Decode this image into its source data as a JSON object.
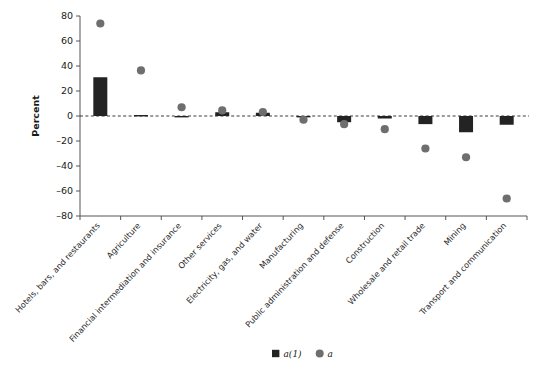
{
  "chart_data": {
    "type": "bar",
    "title": "",
    "subtitle": "",
    "xlabel": "",
    "ylabel": "Percent",
    "ylim": [
      -80,
      80
    ],
    "yticks": [
      80,
      60,
      40,
      20,
      0,
      -20,
      -40,
      -60,
      -80
    ],
    "ytick_labels": [
      "80",
      "60",
      "40",
      "20",
      "0",
      "–20",
      "–40",
      "–60",
      "–80"
    ],
    "grid": false,
    "zero_line": true,
    "legend_position": "bottom-center",
    "categories": [
      "Hotels, bars, and restaurants",
      "Agriculture",
      "Financial intermediation and insurance",
      "Other services",
      "Electricity, gas, and water",
      "Manufacturing",
      "Public administration and defense",
      "Construction",
      "Wholesale and retail trade",
      "Mining",
      "Transport and communication"
    ],
    "series": [
      {
        "name": "a(1)",
        "marker": "square",
        "color": "#232323",
        "render": "bar",
        "values": [
          31,
          0.8,
          -0.5,
          3.0,
          2.6,
          -0.8,
          -5.0,
          -2.0,
          -6.5,
          -13.0,
          -7.0
        ]
      },
      {
        "name": "a",
        "marker": "circle",
        "color": "#6e6e6e",
        "render": "point",
        "values": [
          74,
          36.5,
          7.0,
          4.5,
          3.2,
          -3.0,
          -6.5,
          -10.5,
          -26.0,
          -33.0,
          -66.0
        ]
      }
    ]
  },
  "legend": {
    "entries": [
      {
        "label": "a(1)",
        "marker": "square",
        "color": "#232323"
      },
      {
        "label": "a",
        "marker": "circle",
        "color": "#6e6e6e"
      }
    ]
  },
  "axis": {
    "y_title": "Percent"
  }
}
